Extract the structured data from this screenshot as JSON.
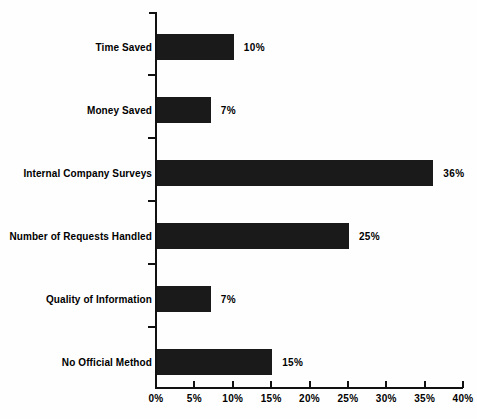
{
  "chart_data": {
    "type": "bar",
    "orientation": "horizontal",
    "title": "",
    "subtitle": "",
    "xlabel": "",
    "ylabel": "",
    "xlim": [
      0,
      40
    ],
    "grid": false,
    "legend": null,
    "categories": [
      "Time Saved",
      "Money Saved",
      "Internal Company Surveys",
      "Number of Requests Handled",
      "Quality of Information",
      "No Official Method"
    ],
    "values": [
      10,
      7,
      36,
      25,
      7,
      15
    ],
    "data_labels": [
      "10%",
      "7%",
      "36%",
      "25%",
      "7%",
      "15%"
    ],
    "xticks": [
      0,
      5,
      10,
      15,
      20,
      25,
      30,
      35,
      40
    ],
    "xtick_labels": [
      "0%",
      "5%",
      "10%",
      "15%",
      "20%",
      "25%",
      "30%",
      "35%",
      "40%"
    ],
    "bar_color": "#1a1a1a",
    "axis_color": "#111111",
    "background_color": "#fefefe"
  }
}
